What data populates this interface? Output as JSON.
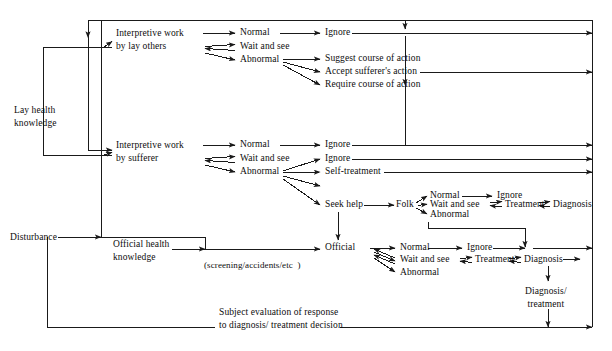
{
  "diagram": {
    "type": "flowchart",
    "nodes": {
      "lay_health_knowledge": "Lay health\nknowledge",
      "disturbance": "Disturbance",
      "official_health_knowledge": "Official health\nknowledge",
      "screening_note": "(screening/accidents/etc  )",
      "interpretive_lay_others": "Interpretive work\nby lay others",
      "interpretive_sufferer": "Interpretive work\nby sufferer",
      "lay_normal": "Normal",
      "lay_wait_and_see": "Wait and see",
      "lay_abnormal": "Abnormal",
      "lay_ignore": "Ignore",
      "suggest_course_of_action": "Suggest course of action",
      "accept_sufferers_action": "Accept sufferer's action",
      "require_course_of_action": "Require course of action",
      "suf_normal": "Normal",
      "suf_wait_and_see": "Wait and see",
      "suf_abnormal": "Abnormal",
      "suf_ignore_top": "Ignore",
      "suf_ignore": "Ignore",
      "self_treatment": "Self-treatment",
      "seek_help": "Seek help",
      "folk": "Folk",
      "folk_normal": "Normal",
      "folk_wait_and_see": "Wait and see",
      "folk_abnormal": "Abnormal",
      "folk_ignore": "Ignore",
      "folk_treatment": "Treatment",
      "folk_diagnosis": "Diagnosis",
      "official": "Official",
      "off_normal": "Normal",
      "off_wait_and_see": "Wait and see",
      "off_abnormal": "Abnormal",
      "off_ignore": "Ignore",
      "off_treatment": "Treatment",
      "off_diagnosis": "Diagnosis",
      "diagnosis_treatment": "Diagnosis/\ntreatment",
      "subject_evaluation": "Subject evaluation of response\nto diagnosis/ treatment decision"
    },
    "colors": {
      "line": "#1a1a1a",
      "text": "#0d0d0d",
      "background": "#ffffff"
    }
  }
}
